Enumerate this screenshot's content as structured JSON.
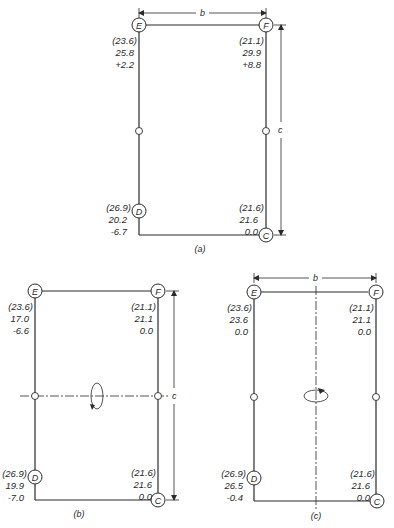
{
  "figure": {
    "dimension_labels": {
      "width": "b",
      "height": "c"
    },
    "panels": [
      {
        "id": "a",
        "caption": "(a)",
        "nodes": {
          "E": {
            "label": "E",
            "values": [
              "(23.6)",
              "25.8",
              "+2.2"
            ]
          },
          "F": {
            "label": "F",
            "values": [
              "(21.1)",
              "29.9",
              "+8.8"
            ]
          },
          "D": {
            "label": "D",
            "values": [
              "(26.9)",
              "20.2",
              "-6.7"
            ]
          },
          "C": {
            "label": "C",
            "values": [
              "(21.6)",
              "21.6",
              "0.0"
            ]
          }
        }
      },
      {
        "id": "b",
        "caption": "(b)",
        "nodes": {
          "E": {
            "label": "E",
            "values": [
              "(23.6)",
              "17.0",
              "-6.6"
            ]
          },
          "F": {
            "label": "F",
            "values": [
              "(21.1)",
              "21.1",
              "0.0"
            ]
          },
          "D": {
            "label": "D",
            "values": [
              "(26.9)",
              "19.9",
              "-7.0"
            ]
          },
          "C": {
            "label": "C",
            "values": [
              "(21.6)",
              "21.6",
              "0.0"
            ]
          }
        }
      },
      {
        "id": "c",
        "caption": "(c)",
        "nodes": {
          "E": {
            "label": "E",
            "values": [
              "(23.6)",
              "23.6",
              "0.0"
            ]
          },
          "F": {
            "label": "F",
            "values": [
              "(21.1)",
              "21.1",
              "0.0"
            ]
          },
          "D": {
            "label": "D",
            "values": [
              "(26.9)",
              "26.5",
              "-0.4"
            ]
          },
          "C": {
            "label": "C",
            "values": [
              "(21.6)",
              "21.6",
              "0.0"
            ]
          }
        }
      }
    ]
  }
}
